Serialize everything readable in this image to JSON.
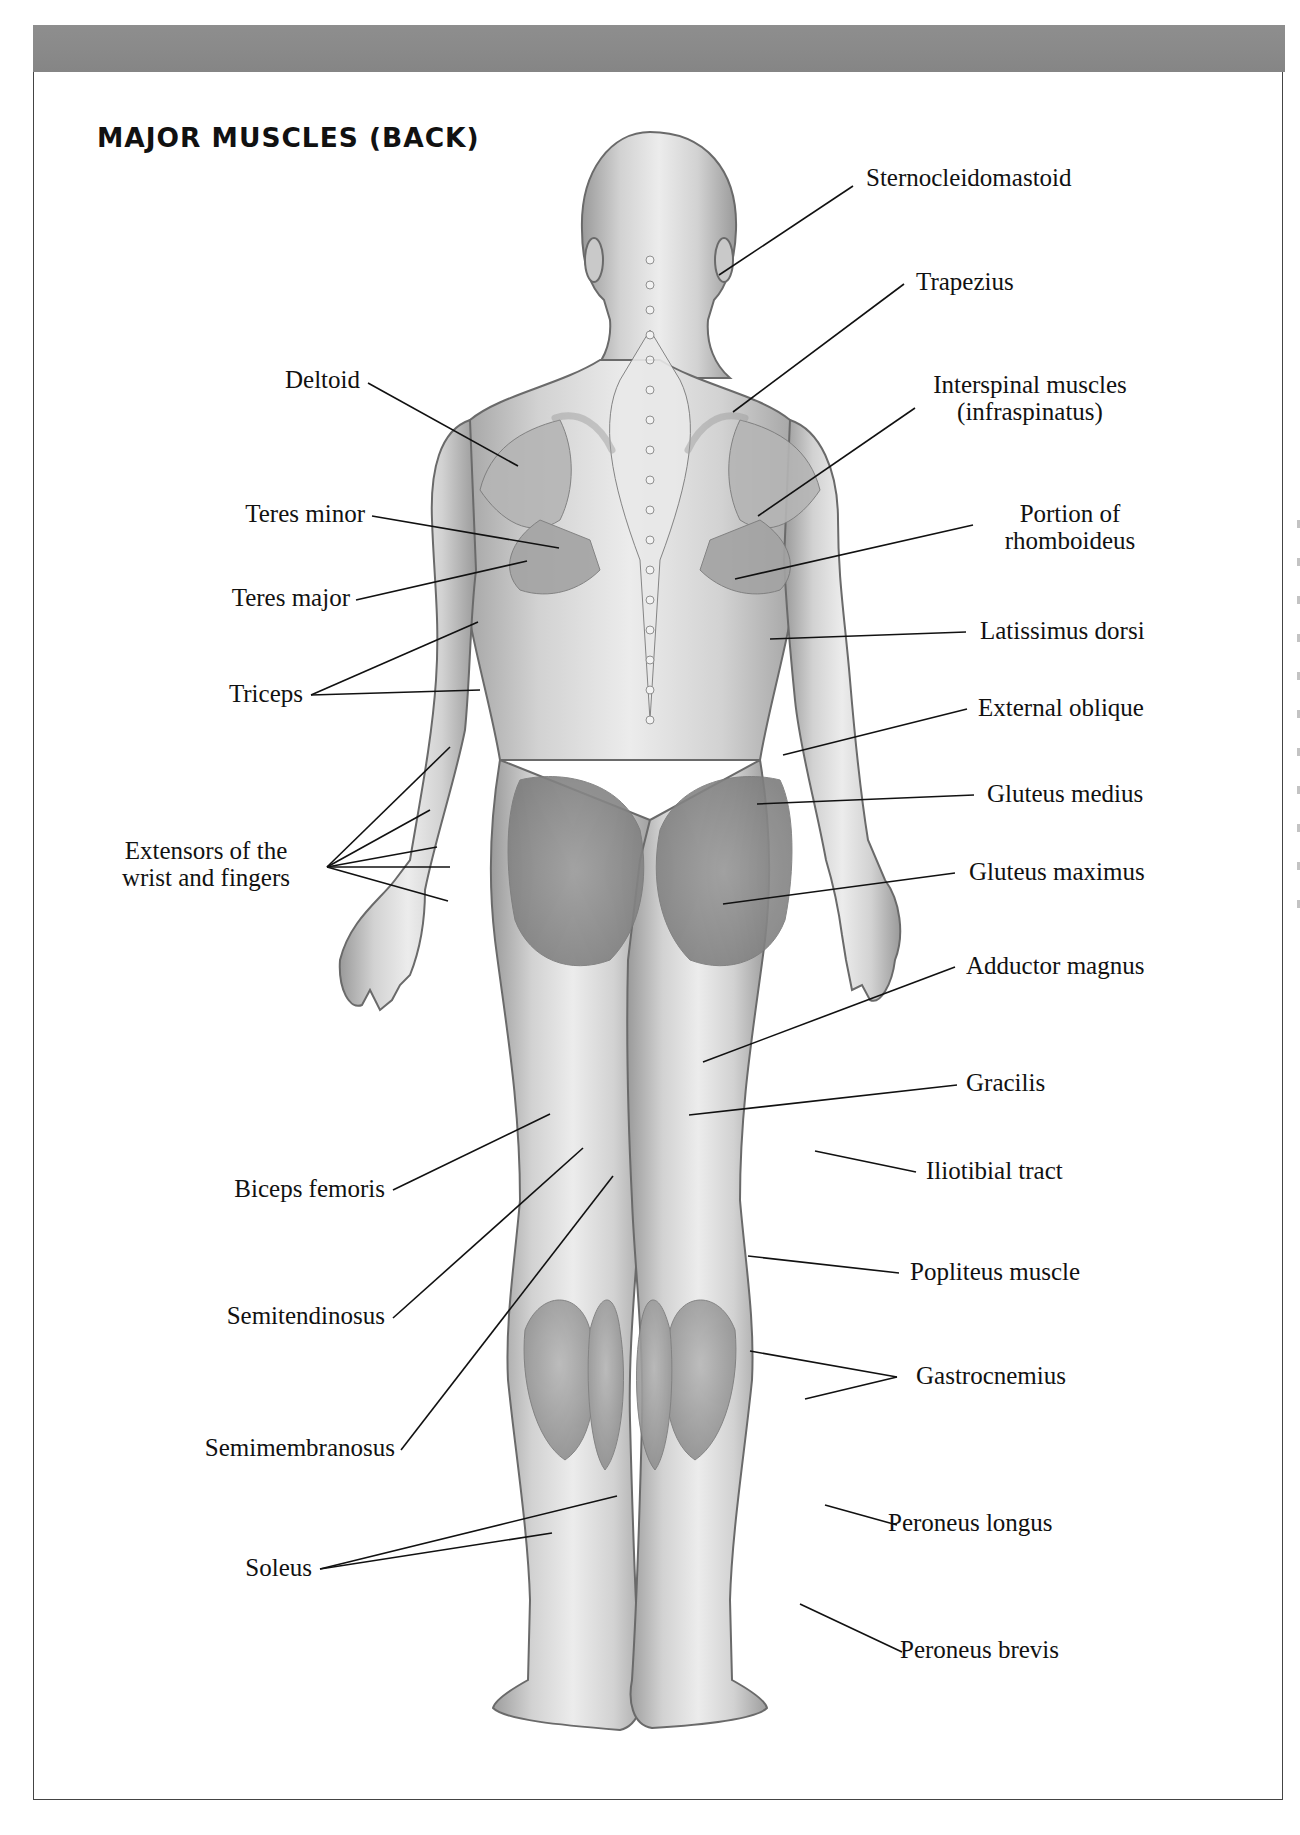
{
  "page": {
    "title": "MAJOR MUSCLES (BACK)",
    "colors": {
      "header_bar": "#8a8a8a",
      "frame_border": "#444444",
      "label_text": "#111111",
      "leader_line": "#111111",
      "figure_fill": "#d9d9d9",
      "figure_shade": "#a9a9a9"
    }
  },
  "labels_left": [
    {
      "id": "deltoid",
      "text": "Deltoid"
    },
    {
      "id": "teres-minor",
      "text": "Teres minor"
    },
    {
      "id": "teres-major",
      "text": "Teres major"
    },
    {
      "id": "triceps",
      "text": "Triceps"
    },
    {
      "id": "extensors",
      "line1": "Extensors of the",
      "line2": "wrist and fingers"
    },
    {
      "id": "biceps-femoris",
      "text": "Biceps femoris"
    },
    {
      "id": "semitendinosus",
      "text": "Semitendinosus"
    },
    {
      "id": "semimembranosus",
      "text": "Semimembranosus"
    },
    {
      "id": "soleus",
      "text": "Soleus"
    }
  ],
  "labels_right": [
    {
      "id": "sternocleidomastoid",
      "text": "Sternocleidomastoid"
    },
    {
      "id": "trapezius",
      "text": "Trapezius"
    },
    {
      "id": "interspinal",
      "line1": "Interspinal muscles",
      "line2": "(infraspinatus)"
    },
    {
      "id": "rhomboideus",
      "line1": "Portion of",
      "line2": "rhomboideus"
    },
    {
      "id": "latissimus-dorsi",
      "text": "Latissimus dorsi"
    },
    {
      "id": "external-oblique",
      "text": "External oblique"
    },
    {
      "id": "gluteus-medius",
      "text": "Gluteus medius"
    },
    {
      "id": "gluteus-maximus",
      "text": "Gluteus maximus"
    },
    {
      "id": "adductor-magnus",
      "text": "Adductor magnus"
    },
    {
      "id": "gracilis",
      "text": "Gracilis"
    },
    {
      "id": "iliotibial-tract",
      "text": "Iliotibial tract"
    },
    {
      "id": "popliteus",
      "text": "Popliteus muscle"
    },
    {
      "id": "gastrocnemius",
      "text": "Gastrocnemius"
    },
    {
      "id": "peroneus-longus",
      "text": "Peroneus longus"
    },
    {
      "id": "peroneus-brevis",
      "text": "Peroneus brevis"
    }
  ],
  "figure": {
    "style": "grayscale-anatomical-illustration"
  }
}
